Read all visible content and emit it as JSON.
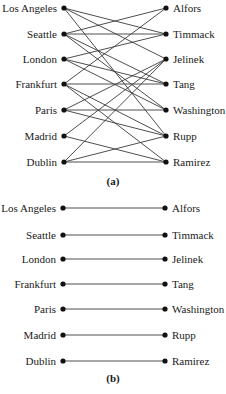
{
  "diagrams": [
    {
      "caption": "(a)",
      "left_nodes": [
        "Los Angeles",
        "Seattle",
        "London",
        "Frankfurt",
        "Paris",
        "Madrid",
        "Dublin"
      ],
      "right_nodes": [
        "Alfors",
        "Timmack",
        "Jelinek",
        "Tang",
        "Washington",
        "Rupp",
        "Ramirez"
      ],
      "edges": [
        [
          "Los Angeles",
          "Timmack"
        ],
        [
          "Los Angeles",
          "Jelinek"
        ],
        [
          "Los Angeles",
          "Rupp"
        ],
        [
          "Seattle",
          "Alfors"
        ],
        [
          "Seattle",
          "Timmack"
        ],
        [
          "Seattle",
          "Tang"
        ],
        [
          "Seattle",
          "Washington"
        ],
        [
          "London",
          "Timmack"
        ],
        [
          "London",
          "Tang"
        ],
        [
          "London",
          "Washington"
        ],
        [
          "Frankfurt",
          "Alfors"
        ],
        [
          "Frankfurt",
          "Tang"
        ],
        [
          "Frankfurt",
          "Rupp"
        ],
        [
          "Frankfurt",
          "Ramirez"
        ],
        [
          "Paris",
          "Jelinek"
        ],
        [
          "Paris",
          "Washington"
        ],
        [
          "Paris",
          "Rupp"
        ],
        [
          "Madrid",
          "Jelinek"
        ],
        [
          "Madrid",
          "Ramirez"
        ],
        [
          "Dublin",
          "Jelinek"
        ],
        [
          "Dublin",
          "Rupp"
        ],
        [
          "Dublin",
          "Ramirez"
        ]
      ]
    },
    {
      "caption": "(b)",
      "left_nodes": [
        "Los Angeles",
        "Seattle",
        "London",
        "Frankfurt",
        "Paris",
        "Madrid",
        "Dublin"
      ],
      "right_nodes": [
        "Alfors",
        "Timmack",
        "Jelinek",
        "Tang",
        "Washington",
        "Rupp",
        "Ramirez"
      ],
      "edges": [
        [
          "Los Angeles",
          "Alfors"
        ],
        [
          "Seattle",
          "Timmack"
        ],
        [
          "London",
          "Jelinek"
        ],
        [
          "Frankfurt",
          "Tang"
        ],
        [
          "Paris",
          "Washington"
        ],
        [
          "Madrid",
          "Rupp"
        ],
        [
          "Dublin",
          "Ramirez"
        ]
      ]
    }
  ]
}
